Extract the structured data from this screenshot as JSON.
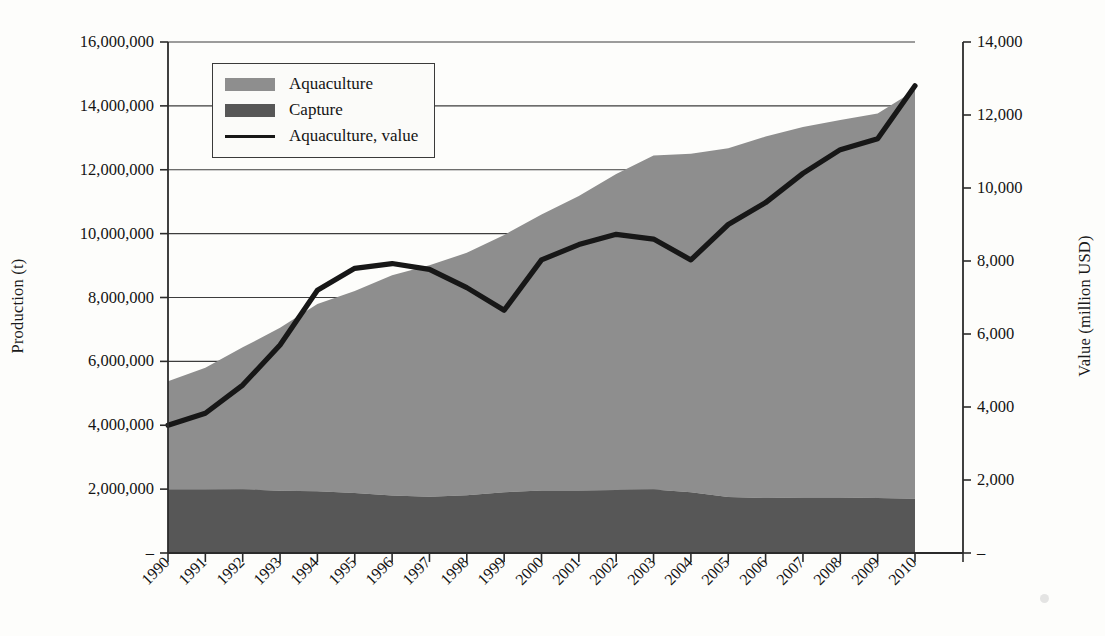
{
  "chart_data": {
    "type": "area",
    "title": "",
    "subtitle": "",
    "xlabel": "",
    "ylabel": "Production (t)",
    "ylabel_secondary": "Value (million USD)",
    "grid": true,
    "legend_position": "top-left",
    "categories": [
      "1990",
      "1991",
      "1992",
      "1993",
      "1994",
      "1995",
      "1996",
      "1997",
      "1998",
      "1999",
      "2000",
      "2001",
      "2002",
      "2003",
      "2004",
      "2005",
      "2006",
      "2007",
      "2008",
      "2009",
      "2010"
    ],
    "ylim": [
      0,
      16000000
    ],
    "ylim_secondary": [
      0,
      14000
    ],
    "ytick_labels": [
      "16,000,000",
      "14,000,000",
      "12,000,000",
      "10,000,000",
      "8,000,000",
      "6,000,000",
      "4,000,000",
      "2,000,000",
      "–"
    ],
    "ytick_values": [
      16000000,
      14000000,
      12000000,
      10000000,
      8000000,
      6000000,
      4000000,
      2000000,
      0
    ],
    "ytick_labels_secondary": [
      "14,000",
      "12,000",
      "10,000",
      "8,000",
      "6,000",
      "4,000",
      "2,000",
      "–"
    ],
    "ytick_values_secondary": [
      14000,
      12000,
      10000,
      8000,
      6000,
      4000,
      2000,
      0
    ],
    "series": [
      {
        "name": "Capture",
        "kind": "area-stacked",
        "axis": "left",
        "color": "#575757",
        "values": [
          1980000,
          1980000,
          1990000,
          1950000,
          1930000,
          1880000,
          1800000,
          1760000,
          1810000,
          1900000,
          1960000,
          1960000,
          1970000,
          1990000,
          1900000,
          1750000,
          1720000,
          1740000,
          1740000,
          1720000,
          1700000
        ]
      },
      {
        "name": "Aquaculture",
        "kind": "area-stacked",
        "axis": "left",
        "color": "#8e8e8e",
        "values": [
          3400000,
          3820000,
          4450000,
          5100000,
          5870000,
          6320000,
          6900000,
          7250000,
          7590000,
          8060000,
          8640000,
          9220000,
          9900000,
          10460000,
          10600000,
          10920000,
          11320000,
          11600000,
          11820000,
          12040000,
          12790000
        ]
      },
      {
        "name": "Aquaculture, value",
        "kind": "line",
        "axis": "right",
        "color": "#171717",
        "values": [
          3500,
          3830,
          4600,
          5700,
          7200,
          7800,
          7930,
          7770,
          7270,
          6650,
          8030,
          8450,
          8730,
          8600,
          8030,
          9000,
          9600,
          10400,
          11050,
          11350,
          12800
        ]
      }
    ]
  },
  "legend": {
    "items": [
      {
        "label": "Aquaculture",
        "marker": "swatch",
        "color": "#8e8e8e"
      },
      {
        "label": "Capture",
        "marker": "swatch",
        "color": "#575757"
      },
      {
        "label": "Aquaculture, value",
        "marker": "line",
        "color": "#171717"
      }
    ]
  }
}
